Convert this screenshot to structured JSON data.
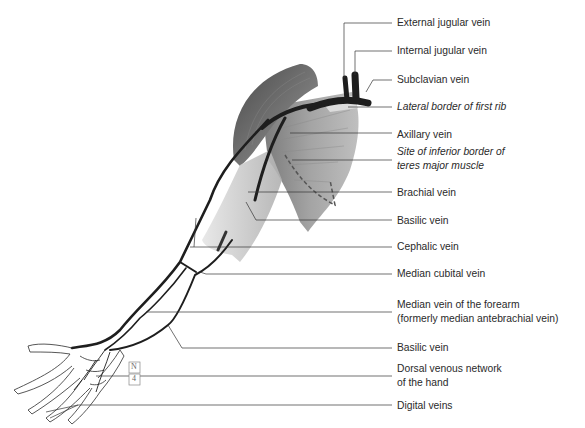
{
  "figure": {
    "labels": [
      {
        "id": "external-jugular-vein",
        "lines": [
          "External jugular vein"
        ],
        "italic": false,
        "top": 16
      },
      {
        "id": "internal-jugular-vein",
        "lines": [
          "Internal jugular vein"
        ],
        "italic": false,
        "top": 44
      },
      {
        "id": "subclavian-vein",
        "lines": [
          "Subclavian vein"
        ],
        "italic": false,
        "top": 73
      },
      {
        "id": "lateral-border-first-rib",
        "lines": [
          "Lateral border of first rib"
        ],
        "italic": true,
        "top": 100
      },
      {
        "id": "axillary-vein",
        "lines": [
          "Axillary vein"
        ],
        "italic": false,
        "top": 128
      },
      {
        "id": "site-inferior-border-teres-major",
        "lines": [
          "Site of inferior border of",
          "teres major muscle"
        ],
        "italic": true,
        "top": 145
      },
      {
        "id": "brachial-vein",
        "lines": [
          "Brachial vein"
        ],
        "italic": false,
        "top": 186
      },
      {
        "id": "basilic-vein-upper",
        "lines": [
          "Basilic vein"
        ],
        "italic": false,
        "top": 214
      },
      {
        "id": "cephalic-vein",
        "lines": [
          "Cephalic vein"
        ],
        "italic": false,
        "top": 240
      },
      {
        "id": "median-cubital-vein",
        "lines": [
          "Median cubital vein"
        ],
        "italic": false,
        "top": 267
      },
      {
        "id": "median-vein-forearm",
        "lines": [
          "Median vein of the forearm",
          "(formerly median antebrachial vein)"
        ],
        "italic": false,
        "top": 298
      },
      {
        "id": "basilic-vein-lower",
        "lines": [
          "Basilic vein"
        ],
        "italic": false,
        "top": 341
      },
      {
        "id": "dorsal-venous-network",
        "lines": [
          "Dorsal venous network",
          "of the hand"
        ],
        "italic": false,
        "top": 362
      },
      {
        "id": "digital-veins",
        "lines": [
          "Digital veins"
        ],
        "italic": false,
        "top": 399
      }
    ],
    "inset_symbol": {
      "top": "N",
      "bottom": "4"
    },
    "colors": {
      "vein": "#1e1e1e",
      "leader": "#333333",
      "muscle_dark": "#555555",
      "muscle_light": "#a8a8a8",
      "outline": "#444444",
      "label_text": "#2a2a2a"
    }
  }
}
